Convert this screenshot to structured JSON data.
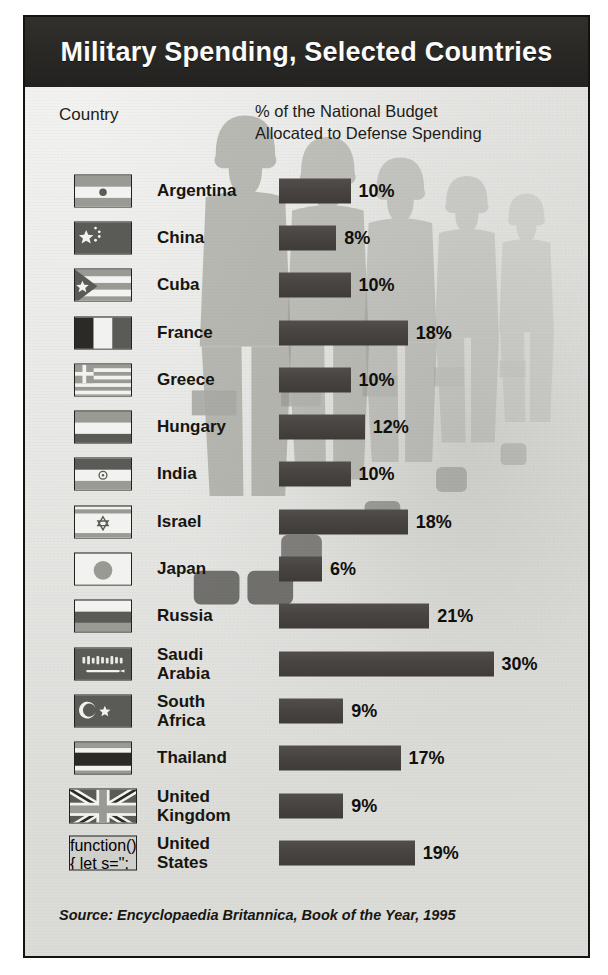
{
  "header": {
    "title": "Military Spending, Selected Countries"
  },
  "columns": {
    "country_header": "Country",
    "percent_header_line1": "% of the National Budget",
    "percent_header_line2": "Allocated to Defense Spending"
  },
  "source": {
    "text": "Source: Encyclopaedia Britannica, Book of the Year, 1995"
  },
  "colors": {
    "header_bar": "#2a2825",
    "bar_fill": "#474442",
    "card_background": "#e8e8e6",
    "border": "#141312",
    "value_text": "#100f0b"
  },
  "chart_data": {
    "type": "bar",
    "orientation": "horizontal",
    "title": "Military Spending, Selected Countries",
    "xlabel": "% of the National Budget Allocated to Defense Spending",
    "ylabel": "Country",
    "units": "percent",
    "grid": false,
    "legend": null,
    "xlim": [
      0,
      30
    ],
    "source": "Encyclopaedia Britannica, Book of the Year, 1995",
    "categories": [
      "Argentina",
      "China",
      "Cuba",
      "France",
      "Greece",
      "Hungary",
      "India",
      "Israel",
      "Japan",
      "Russia",
      "Saudi Arabia",
      "South Africa",
      "Thailand",
      "United Kingdom",
      "United States"
    ],
    "values": [
      10,
      8,
      10,
      18,
      10,
      12,
      10,
      18,
      6,
      21,
      30,
      9,
      17,
      9,
      19
    ],
    "value_labels": [
      "10%",
      "8%",
      "10%",
      "18%",
      "10%",
      "12%",
      "10%",
      "18%",
      "6%",
      "21%",
      "30%",
      "9%",
      "17%",
      "9%",
      "19%"
    ]
  },
  "rows": [
    {
      "country": "Argentina",
      "name_lines": [
        "Argentina"
      ],
      "value": 10,
      "label": "10%",
      "flag": "flag-argentina"
    },
    {
      "country": "China",
      "name_lines": [
        "China"
      ],
      "value": 8,
      "label": "8%",
      "flag": "flag-china"
    },
    {
      "country": "Cuba",
      "name_lines": [
        "Cuba"
      ],
      "value": 10,
      "label": "10%",
      "flag": "flag-cuba"
    },
    {
      "country": "France",
      "name_lines": [
        "France"
      ],
      "value": 18,
      "label": "18%",
      "flag": "flag-france"
    },
    {
      "country": "Greece",
      "name_lines": [
        "Greece"
      ],
      "value": 10,
      "label": "10%",
      "flag": "flag-greece"
    },
    {
      "country": "Hungary",
      "name_lines": [
        "Hungary"
      ],
      "value": 12,
      "label": "12%",
      "flag": "flag-hungary"
    },
    {
      "country": "India",
      "name_lines": [
        "India"
      ],
      "value": 10,
      "label": "10%",
      "flag": "flag-india"
    },
    {
      "country": "Israel",
      "name_lines": [
        "Israel"
      ],
      "value": 18,
      "label": "18%",
      "flag": "flag-israel"
    },
    {
      "country": "Japan",
      "name_lines": [
        "Japan"
      ],
      "value": 6,
      "label": "6%",
      "flag": "flag-japan"
    },
    {
      "country": "Russia",
      "name_lines": [
        "Russia"
      ],
      "value": 21,
      "label": "21%",
      "flag": "flag-russia"
    },
    {
      "country": "Saudi Arabia",
      "name_lines": [
        "Saudi",
        "Arabia"
      ],
      "value": 30,
      "label": "30%",
      "flag": "flag-saudi-arabia"
    },
    {
      "country": "South Africa",
      "name_lines": [
        "South",
        "Africa"
      ],
      "value": 9,
      "label": "9%",
      "flag": "flag-south-africa"
    },
    {
      "country": "Thailand",
      "name_lines": [
        "Thailand"
      ],
      "value": 17,
      "label": "17%",
      "flag": "flag-thailand"
    },
    {
      "country": "United Kingdom",
      "name_lines": [
        "United",
        "Kingdom"
      ],
      "value": 9,
      "label": "9%",
      "flag": "flag-united-kingdom"
    },
    {
      "country": "United States",
      "name_lines": [
        "United",
        "States"
      ],
      "value": 19,
      "label": "19%",
      "flag": "flag-united-states"
    }
  ]
}
